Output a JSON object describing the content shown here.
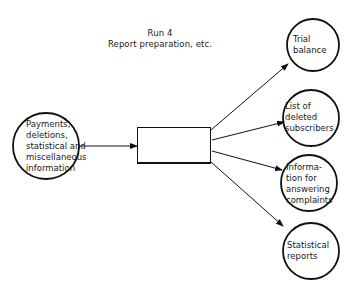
{
  "diagram": {
    "title": {
      "line1": "Run 4",
      "line2": "Report preparation, etc."
    },
    "input": {
      "label_lines": [
        "Payments,",
        "deletions,",
        "statistical and",
        "miscellaneous",
        "information"
      ]
    },
    "process": {
      "label": ""
    },
    "outputs": [
      {
        "label_lines": [
          "Trial",
          "balance"
        ]
      },
      {
        "label_lines": [
          "List of",
          "deleted",
          "subscribers"
        ]
      },
      {
        "label_lines": [
          "Informa-",
          "tion for",
          "answering",
          "complaints"
        ]
      },
      {
        "label_lines": [
          "Statistical",
          "reports"
        ]
      }
    ],
    "colors": {
      "stroke": "#111111",
      "background": "#ffffff"
    }
  }
}
